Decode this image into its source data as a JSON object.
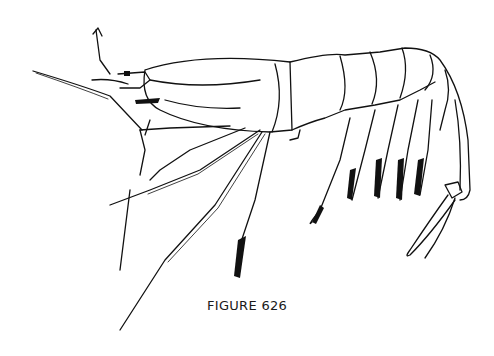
{
  "figure": {
    "caption": "FIGURE 626",
    "colors": {
      "ink": "#111111",
      "background": "#ffffff"
    }
  }
}
